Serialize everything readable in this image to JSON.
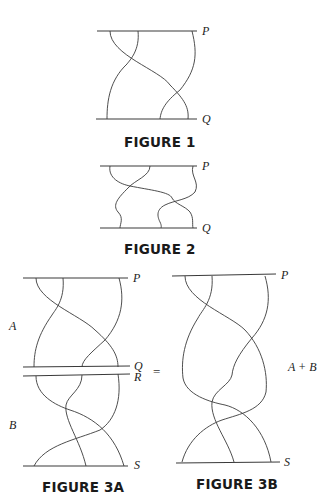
{
  "figures": [
    {
      "id": "fig1",
      "caption": "FIGURE 1",
      "top_label": "P",
      "bottom_label": "Q"
    },
    {
      "id": "fig2",
      "caption": "FIGURE 2",
      "top_label": "P",
      "bottom_label": "Q"
    },
    {
      "id": "fig3a",
      "caption": "FIGURE 3A",
      "labels": {
        "p": "P",
        "q": "Q",
        "r": "R",
        "s": "S"
      },
      "side_labels": {
        "upper": "A",
        "lower": "B"
      }
    },
    {
      "id": "fig3b",
      "caption": "FIGURE 3B",
      "labels": {
        "p": "P",
        "s": "S"
      },
      "side_label": "A + B"
    }
  ],
  "equals_sign": "="
}
